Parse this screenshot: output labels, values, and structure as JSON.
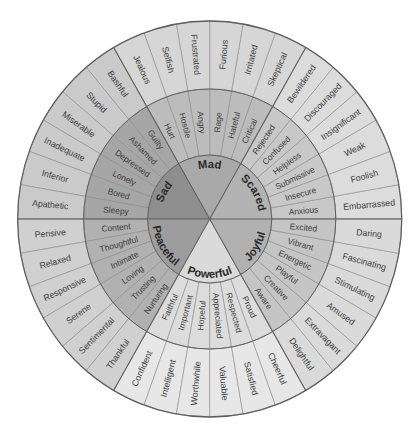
{
  "wheel": {
    "line_color_major": "#5f5f5f",
    "line_color_minor": "#8a8a8a",
    "text_color": "#3d3d3d",
    "core_text_color": "#2a2a2a",
    "core": [
      {
        "name": "Scared",
        "colors": {
          "core": "#b3b3b3",
          "middle": "#c8c8c8",
          "outer": "#dcdcdc"
        },
        "secondary": [
          "Anxious",
          "Insecure",
          "Submissive",
          "Helpless",
          "Confused",
          "Rejected"
        ],
        "tertiary": [
          "Embarrassed",
          "Foolish",
          "Weak",
          "Insignificant",
          "Discouraged",
          "Bewildered"
        ]
      },
      {
        "name": "Mad",
        "colors": {
          "core": "#a9a9a9",
          "middle": "#bcbcbc",
          "outer": "#d6d6d6"
        },
        "secondary": [
          "Critical",
          "Hateful",
          "Rage",
          "Angry",
          "Hostile",
          "Hurt"
        ],
        "tertiary": [
          "Skeptical",
          "Irritated",
          "Furious",
          "Frustrated",
          "Selfish",
          "Jealous"
        ]
      },
      {
        "name": "Sad",
        "colors": {
          "core": "#8e8e8e",
          "middle": "#a6a6a6",
          "outer": "#cacaca"
        },
        "secondary": [
          "Guilty",
          "Ashamed",
          "Depressed",
          "Lonely",
          "Bored",
          "Sleepy"
        ],
        "tertiary": [
          "Bashful",
          "Stupid",
          "Miserable",
          "Inadequate",
          "Inferior",
          "Apathetic"
        ]
      },
      {
        "name": "Peaceful",
        "colors": {
          "core": "#9d9d9d",
          "middle": "#b1b1b1",
          "outer": "#d0d0d0"
        },
        "secondary": [
          "Content",
          "Thoughtful",
          "Intimate",
          "Loving",
          "Trusting",
          "Nurturing"
        ],
        "tertiary": [
          "Pensive",
          "Relaxed",
          "Responsive",
          "Serene",
          "Sentimental",
          "Thankful"
        ]
      },
      {
        "name": "Powerful",
        "colors": {
          "core": "#dadada",
          "middle": "#dcdcdc",
          "outer": "#e7e7e7"
        },
        "secondary": [
          "Faithful",
          "Important",
          "Hopeful",
          "Appreciated",
          "Respected",
          "Proud"
        ],
        "tertiary": [
          "Confident",
          "Intelligent",
          "Worthwhile",
          "Valuable",
          "Satisfied",
          "Cheerful"
        ]
      },
      {
        "name": "Joyful",
        "colors": {
          "core": "#b1b1b1",
          "middle": "#c5c5c5",
          "outer": "#dadada"
        },
        "secondary": [
          "Aware",
          "Creative",
          "Playful",
          "Energetic",
          "Vibrant",
          "Excited"
        ],
        "tertiary": [
          "Delightful",
          "Extravagant",
          "Amused",
          "Stimulating",
          "Fascinating",
          "Daring"
        ]
      }
    ]
  }
}
